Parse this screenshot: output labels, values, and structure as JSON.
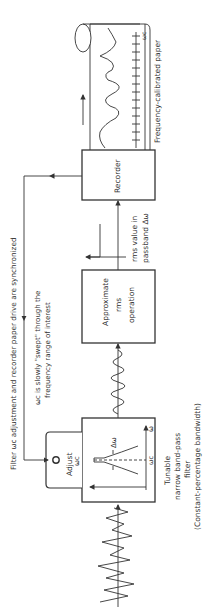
{
  "diagram": {
    "orientation": "rotated-90-ccw",
    "blocks": {
      "filter": {
        "label_line1": "Tunable",
        "label_line2": "narrow band-pass",
        "label_line3": "filter",
        "label_line4": "(Constant-percentage bandwidth)",
        "adjust_label": "Adjust",
        "adjust_symbol": "ωc",
        "axis_label": "ω",
        "center_label": "ωc",
        "bandwidth_label": "Δω"
      },
      "rms": {
        "label_line1": "Approximate",
        "label_line2": "rms",
        "label_line3": "operation"
      },
      "recorder": {
        "label": "Recorder"
      }
    },
    "annotations": {
      "rms_output_line1": "rms value in",
      "rms_output_line2": "passband Δω",
      "paper_label": "Frequency-calibrated paper",
      "paper_scale_label": "ωc",
      "sync_note": "Filter ωc adjustment and recorder paper drive are synchronized",
      "sweep_note_line1": "ωc is slowly \"swept\" through the",
      "sweep_note_line2": "frequency range of interest"
    },
    "colors": {
      "line": "#333333",
      "background": "#ffffff"
    }
  }
}
